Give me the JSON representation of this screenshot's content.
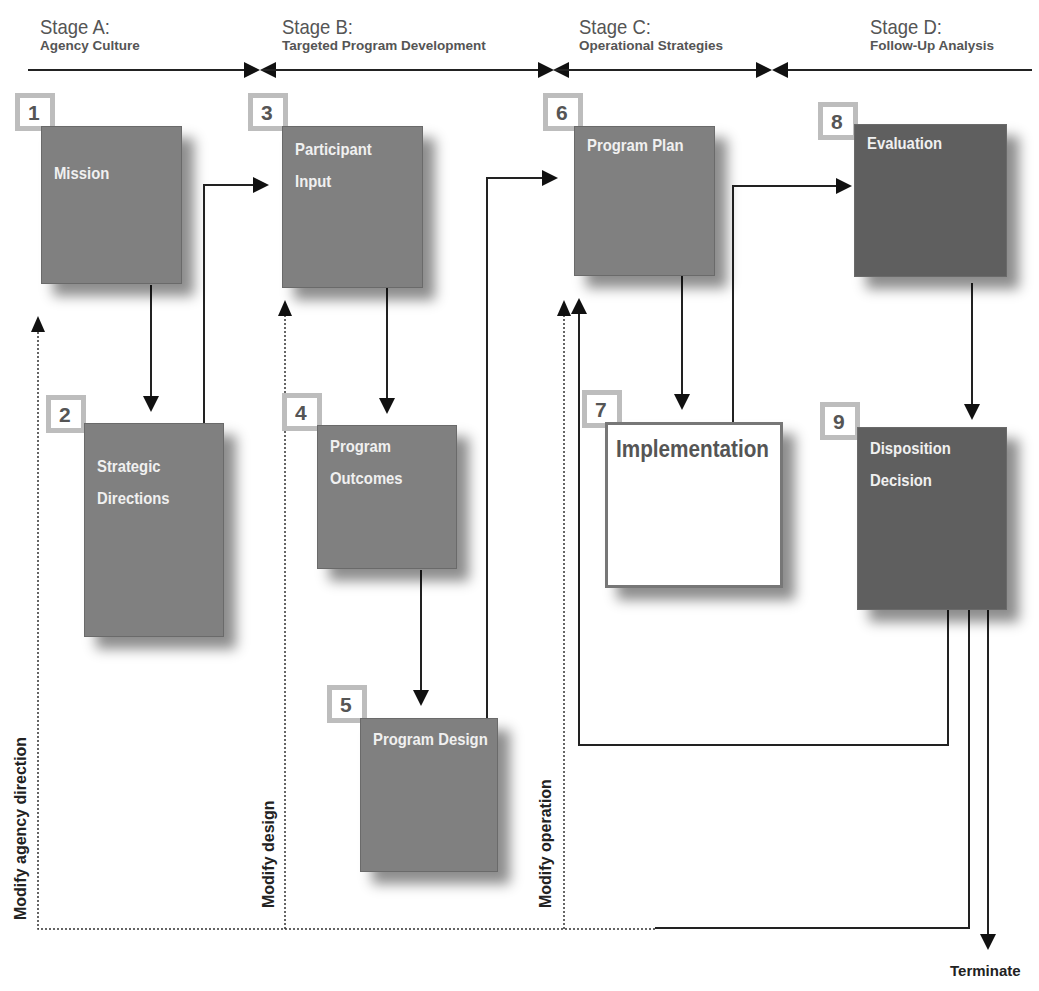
{
  "stages": [
    {
      "title": "Stage A:",
      "subtitle": "Agency Culture"
    },
    {
      "title": "Stage B:",
      "subtitle": "Targeted Program Development"
    },
    {
      "title": "Stage C:",
      "subtitle": "Operational Strategies"
    },
    {
      "title": "Stage D:",
      "subtitle": "Follow-Up Analysis"
    }
  ],
  "nodes": [
    {
      "num": "1",
      "label": "Mission",
      "stage": "A"
    },
    {
      "num": "2",
      "label_line1": "Strategic",
      "label_line2": "Directions",
      "stage": "A"
    },
    {
      "num": "3",
      "label_line1": "Participant",
      "label_line2": "Input",
      "stage": "B"
    },
    {
      "num": "4",
      "label_line1": "Program",
      "label_line2": "Outcomes",
      "stage": "B"
    },
    {
      "num": "5",
      "label": "Program Design",
      "stage": "B"
    },
    {
      "num": "6",
      "label": "Program Plan",
      "stage": "C"
    },
    {
      "num": "7",
      "label": "Implementation",
      "stage": "C"
    },
    {
      "num": "8",
      "label": "Evaluation",
      "stage": "D"
    },
    {
      "num": "9",
      "label_line1": "Disposition",
      "label_line2": "Decision",
      "stage": "D"
    }
  ],
  "feedback_labels": {
    "agency": "Modify agency direction",
    "design": "Modify design",
    "operation": "Modify operation"
  },
  "terminal": "Terminate",
  "colors": {
    "box": "#808080",
    "box_dark": "#5f5f5f",
    "numbox_border": "#bdbdbd",
    "text": "#555555"
  }
}
